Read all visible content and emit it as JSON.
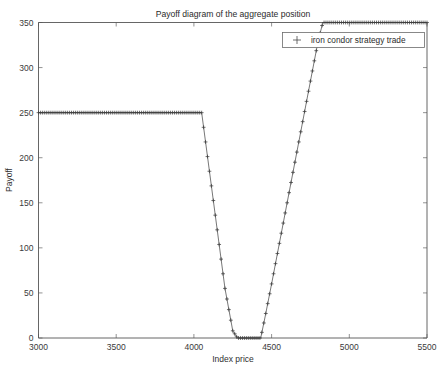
{
  "chart_data": {
    "type": "line",
    "title": "Payoff diagram of the aggregate position",
    "xlabel": "Index price",
    "ylabel": "Payoff",
    "xlim": [
      3000,
      5500
    ],
    "ylim": [
      0,
      350
    ],
    "xticks": [
      3000,
      3500,
      4000,
      4500,
      5000,
      5500
    ],
    "yticks": [
      0,
      50,
      100,
      150,
      200,
      250,
      300,
      350
    ],
    "grid": false,
    "legend_position": "upper right",
    "marker": "+",
    "series": [
      {
        "name": "iron condor strategy trade",
        "x": [
          3000,
          3050,
          3100,
          3150,
          3200,
          3250,
          3300,
          3350,
          3400,
          3450,
          3500,
          3550,
          3600,
          3650,
          3700,
          3750,
          3800,
          3850,
          3900,
          3950,
          4000,
          4050,
          4100,
          4150,
          4200,
          4250,
          4280,
          4300,
          4350,
          4400,
          4430,
          4460,
          4500,
          4550,
          4600,
          4650,
          4700,
          4750,
          4800,
          4830,
          4880,
          4950,
          5000,
          5100,
          5200,
          5300,
          5400,
          5500
        ],
        "y": [
          250,
          250,
          250,
          250,
          250,
          250,
          250,
          250,
          250,
          250,
          250,
          250,
          250,
          250,
          250,
          250,
          250,
          250,
          250,
          250,
          250,
          250,
          185,
          120,
          55,
          8,
          0,
          0,
          0,
          0,
          0,
          25,
          60,
          105,
          150,
          195,
          240,
          285,
          330,
          350,
          350,
          350,
          350,
          350,
          350,
          350,
          350,
          350
        ]
      }
    ]
  },
  "legend": {
    "entries": [
      {
        "label": "iron condor strategy trade",
        "marker": "+"
      }
    ]
  }
}
